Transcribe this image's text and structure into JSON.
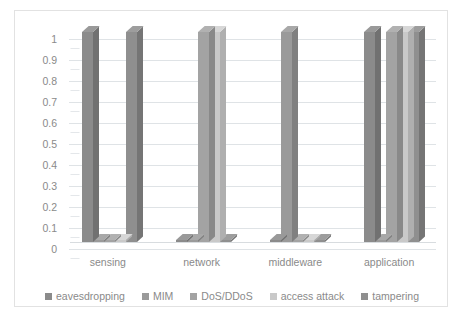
{
  "chart_data": {
    "type": "bar",
    "title": "",
    "subtitle": "",
    "xlabel": "",
    "ylabel": "",
    "ylim": [
      0,
      1
    ],
    "ytick_labels": [
      "1",
      "0.9",
      "0.8",
      "0.7",
      "0.6",
      "0.5",
      "0.4",
      "0.3",
      "0.2",
      "0.1",
      "0"
    ],
    "ytick_values": [
      1,
      0.9,
      0.8,
      0.7,
      0.6,
      0.5,
      0.4,
      0.3,
      0.2,
      0.1,
      0
    ],
    "grid": true,
    "legend_position": "bottom",
    "style": "3d-clustered-column",
    "categories": [
      "sensing",
      "network",
      "middleware",
      "application"
    ],
    "series": [
      {
        "name": "eavesdropping",
        "color": "#8b8b8b",
        "values": [
          1,
          0,
          0,
          1
        ]
      },
      {
        "name": "MIM",
        "color": "#9a9a9a",
        "values": [
          0,
          0,
          1,
          0
        ]
      },
      {
        "name": "DoS/DDoS",
        "color": "#a3a3a3",
        "values": [
          0,
          1,
          0,
          1
        ]
      },
      {
        "name": "access attack",
        "color": "#c9c9c9",
        "values": [
          0,
          1,
          0,
          1
        ]
      },
      {
        "name": "tampering",
        "color": "#8f8f8f",
        "values": [
          1,
          0,
          0,
          1
        ]
      }
    ]
  },
  "axes": {
    "y_ticks": [
      "1",
      "0.9",
      "0.8",
      "0.7",
      "0.6",
      "0.5",
      "0.4",
      "0.3",
      "0.2",
      "0.1",
      "0"
    ],
    "x_categories": [
      "sensing",
      "network",
      "middleware",
      "application"
    ]
  },
  "legend": {
    "items": [
      {
        "label": "eavesdropping",
        "color": "#8b8b8b"
      },
      {
        "label": "MIM",
        "color": "#9a9a9a"
      },
      {
        "label": "DoS/DDoS",
        "color": "#a3a3a3"
      },
      {
        "label": "access attack",
        "color": "#c9c9c9"
      },
      {
        "label": "tampering",
        "color": "#8f8f8f"
      }
    ]
  },
  "colors": {
    "frame_border": "#e2e2e2",
    "gridline": "#dfe3e6",
    "text": "#8a8a8a",
    "background": "#ffffff"
  }
}
